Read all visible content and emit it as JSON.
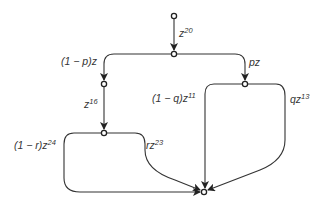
{
  "diagram": {
    "type": "signal flow graph",
    "nodes": [
      "source",
      "split1",
      "left1",
      "right1",
      "left2",
      "sink"
    ],
    "edges": [
      {
        "from": "source",
        "to": "split1",
        "label": {
          "base": "z",
          "sup": "20"
        }
      },
      {
        "from": "split1",
        "to": "left1",
        "label": {
          "base": "(1 − p)z",
          "sup": ""
        }
      },
      {
        "from": "split1",
        "to": "right1",
        "label": {
          "base": "pz",
          "sup": ""
        }
      },
      {
        "from": "left1",
        "to": "left2",
        "label": {
          "base": "z",
          "sup": "16"
        }
      },
      {
        "from": "right1",
        "to": "sink",
        "label": {
          "base": "(1 − q)z",
          "sup": "11"
        }
      },
      {
        "from": "right1",
        "to": "sink",
        "label": {
          "base": "qz",
          "sup": "13"
        }
      },
      {
        "from": "left2",
        "to": "sink",
        "label": {
          "base": "(1 − r)z",
          "sup": "24"
        }
      },
      {
        "from": "left2",
        "to": "sink",
        "label": {
          "base": "rz",
          "sup": "23"
        }
      }
    ]
  }
}
